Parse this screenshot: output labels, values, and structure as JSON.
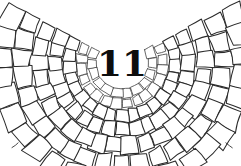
{
  "figure": {
    "kind": "botanical-cell-tissue-illustration",
    "label": "11",
    "label_description": "bold slab-serif numeral at center of concentric cell rings",
    "style": "hand-drawn line art, black ink on white",
    "background_color": "#ffffff",
    "line_color": "#2a2a2a",
    "label_color": "#0d0d0d",
    "center_x": 122,
    "center_y": 63,
    "width": 241,
    "height": 166,
    "ring_count": 7,
    "arc_span_degrees": 200,
    "shape": "fan / semicircular tissue section, cropped at top edge"
  },
  "rings": [
    {
      "index": 0,
      "radius": 26,
      "thickness": 9,
      "cells": 12,
      "note": "innermost ring around label"
    },
    {
      "index": 1,
      "radius": 36,
      "thickness": 10,
      "cells": 16,
      "note": "second ring"
    },
    {
      "index": 2,
      "radius": 47,
      "thickness": 12,
      "cells": 19,
      "note": "third ring"
    },
    {
      "index": 3,
      "radius": 60,
      "thickness": 14,
      "cells": 21,
      "note": "fourth ring"
    },
    {
      "index": 4,
      "radius": 75,
      "thickness": 16,
      "cells": 22,
      "note": "fifth ring"
    },
    {
      "index": 5,
      "radius": 92,
      "thickness": 18,
      "cells": 23,
      "note": "sixth ring, elongated cells"
    },
    {
      "index": 6,
      "radius": 111,
      "thickness": 20,
      "cells": 24,
      "note": "outermost ring, largest cells"
    }
  ],
  "ticks": {
    "count": 9,
    "length": 9,
    "note": "short radial tick marks extending beyond outermost ring at bottom and top"
  }
}
